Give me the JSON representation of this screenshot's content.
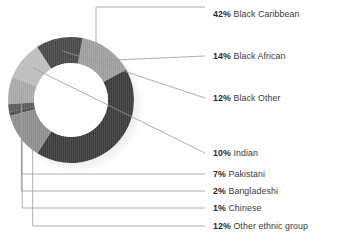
{
  "chart_data": {
    "type": "pie",
    "variant": "donut",
    "title": "",
    "subtitle": "",
    "xlabel": "",
    "ylabel": "",
    "legend_position": "right-with-leader-lines",
    "grid": false,
    "units": "percent",
    "total": 100,
    "categories": [
      "Black Caribbean",
      "Black African",
      "Black Other",
      "Indian",
      "Pakistani",
      "Bangladeshi",
      "Chinese",
      "Other ethnic group"
    ],
    "values": [
      42,
      14,
      12,
      10,
      7,
      2,
      1,
      12
    ],
    "slices": [
      {
        "label": "Black Caribbean",
        "percent": 42,
        "percent_text": "42%",
        "color": "#3b3b3b",
        "start_angle": -29,
        "end_angle": 122.2,
        "leader_anchor_angle": -60,
        "label_x": 213,
        "label_y": 14,
        "leader_line": "vertical-then-horizontal"
      },
      {
        "label": "Black African",
        "percent": 14,
        "percent_text": "14%",
        "color": "#9e9e9e",
        "start_angle": -79.4,
        "end_angle": -29,
        "leader_anchor_angle": -52,
        "label_x": 213,
        "label_y": 56,
        "leader_line": "horizontal"
      },
      {
        "label": "Black Other",
        "percent": 12,
        "percent_text": "12%",
        "color": "#474747",
        "start_angle": -122.6,
        "end_angle": -79.4,
        "leader_anchor_angle": -100,
        "label_x": 213,
        "label_y": 98,
        "leader_line": "horizontal"
      },
      {
        "label": "Indian",
        "percent": 10,
        "percent_text": "10%",
        "color": "#bdbdbd",
        "start_angle": -158.6,
        "end_angle": -122.6,
        "leader_anchor_angle": -140,
        "label_x": 213,
        "label_y": 153,
        "leader_line": "horizontal"
      },
      {
        "label": "Pakistani",
        "percent": 7,
        "percent_text": "7%",
        "color": "#a8a8a8",
        "start_angle": -183.8,
        "end_angle": -158.6,
        "leader_anchor_angle": -172,
        "label_x": 213,
        "label_y": 174,
        "leader_line": "elbow"
      },
      {
        "label": "Bangladeshi",
        "percent": 2,
        "percent_text": "2%",
        "color": "#5a5a5a",
        "start_angle": -191,
        "end_angle": -183.8,
        "leader_anchor_angle": -187,
        "label_x": 213,
        "label_y": 191,
        "leader_line": "elbow"
      },
      {
        "label": "Chinese",
        "percent": 1,
        "percent_text": "1%",
        "color": "#4d4d4d",
        "start_angle": -194.6,
        "end_angle": -191,
        "leader_anchor_angle": -193,
        "label_x": 213,
        "label_y": 208,
        "leader_line": "elbow"
      },
      {
        "label": "Other ethnic group",
        "percent": 12,
        "percent_text": "12%",
        "color": "#8d8d8d",
        "start_angle": -237.8,
        "end_angle": -194.6,
        "leader_anchor_angle": -220,
        "label_x": 213,
        "label_y": 226,
        "leader_line": "elbow"
      }
    ],
    "geometry": {
      "center_x": 71,
      "center_y": 100,
      "outer_radius": 63,
      "inner_radius": 37,
      "start_angle_deg": -29,
      "direction": "counterclockwise-from-upper-right"
    },
    "colors": {
      "background": "#ffffff",
      "leader_line": "#9b9b9b",
      "text": "#333333",
      "shadow": "#d8d8d8"
    }
  },
  "legend": {
    "entries": [
      {
        "percent_text": "42%",
        "name": "Black Caribbean"
      },
      {
        "percent_text": "14%",
        "name": "Black African"
      },
      {
        "percent_text": "12%",
        "name": "Black Other"
      },
      {
        "percent_text": "10%",
        "name": "Indian"
      },
      {
        "percent_text": "7%",
        "name": "Pakistani"
      },
      {
        "percent_text": "2%",
        "name": "Bangladeshi"
      },
      {
        "percent_text": "1%",
        "name": "Chinese"
      },
      {
        "percent_text": "12%",
        "name": "Other ethnic group"
      }
    ]
  }
}
